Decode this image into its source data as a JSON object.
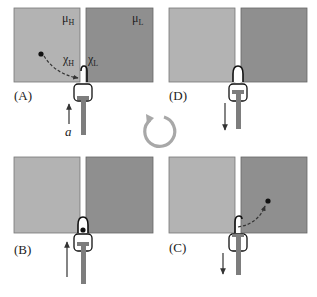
{
  "figure": {
    "type": "maxwell-demon cycle diagram",
    "colors": {
      "high_reservoir": "#b3b3b3",
      "low_reservoir": "#8f8f8f",
      "piston": "#7d7d7d",
      "outline": "#111111",
      "cycle_arrow": "#a8a8a8",
      "arrow": "#333333"
    },
    "panels": [
      {
        "id": "A",
        "label": "(A)",
        "left_label": "μ",
        "left_sub": "H",
        "right_label": "μ",
        "right_sub": "L",
        "chi_left": "χ",
        "chi_left_sub": "H",
        "chi_right": "χ",
        "chi_right_sub": "L",
        "force_label": "a",
        "arrow_direction": "up",
        "particle": "in high reservoir moving toward gate"
      },
      {
        "id": "D",
        "label": "(D)",
        "arrow_direction": "down",
        "particle": "none"
      },
      {
        "id": "B",
        "label": "(B)",
        "arrow_direction": "up",
        "particle": "trapped in gate"
      },
      {
        "id": "C",
        "label": "(C)",
        "arrow_direction": "down",
        "particle": "released into low reservoir"
      }
    ],
    "center": {
      "icon": "cycle-arrow-icon",
      "direction": "clockwise"
    }
  }
}
